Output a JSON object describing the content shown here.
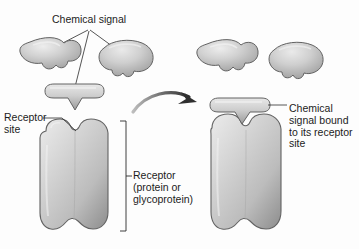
{
  "figure": {
    "kind": "biology-diagram",
    "background_color": "#fdfdfd",
    "ink_color": "#1c1c1c",
    "shape_fill": "#c8c8c8",
    "shape_highlight": "#e3e3e3",
    "shape_shadow": "#8e8e8e",
    "shape_outline": "#5a5a5a"
  },
  "labels": {
    "chemical_signal": "Chemical signal",
    "receptor_site_line1": "Receptor",
    "receptor_site_line2": "site",
    "receptor_protein_line1": "Receptor",
    "receptor_protein_line2": "(protein or",
    "receptor_protein_line3": "glycoprotein)",
    "bound_line1": "Chemical",
    "bound_line2": "signal bound",
    "bound_line3": "to its receptor",
    "bound_line4": "site"
  },
  "elements": {
    "blob_left_label": "chemical-signal-molecule-lobed",
    "blob_right_label": "chemical-signal-molecule-kidney",
    "ligand_label": "chemical-signal-molecule-wedge",
    "receptor_label": "receptor-protein-body",
    "arrow_label": "binding-transition-arrow",
    "bracket_label": "receptor-extent-bracket",
    "bound_blob_left_label": "chemical-signal-molecule-lobed-free",
    "bound_blob_right_label": "chemical-signal-molecule-kidney-free",
    "bound_complex_label": "receptor-with-bound-signal"
  }
}
